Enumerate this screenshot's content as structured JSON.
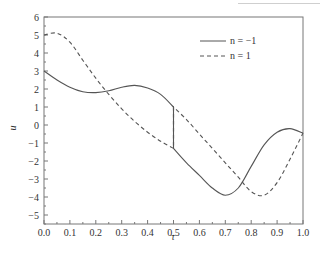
{
  "chart_data": {
    "type": "line",
    "title": "",
    "xlabel": "τ",
    "ylabel": "u",
    "xlim": [
      0.0,
      1.0
    ],
    "ylim": [
      -5.5,
      6
    ],
    "grid": false,
    "legend_position": "upper right (inside)",
    "x_ticks": [
      "0.0",
      "0.1",
      "0.2",
      "0.3",
      "0.4",
      "0.5",
      "0.6",
      "0.7",
      "0.8",
      "0.9",
      "1.0"
    ],
    "y_ticks": [
      "6",
      "5",
      "4",
      "3",
      "2",
      "1",
      "0",
      "−1",
      "−2",
      "−3",
      "−4",
      "−5"
    ],
    "annotations": [
      "vertical jump at τ = 0.5 (curves swap between u ≈ 1.0 and u ≈ −1.3)"
    ],
    "series": [
      {
        "name": "n = −1",
        "style": "solid",
        "color": "#555555",
        "x": [
          0.0,
          0.05,
          0.1,
          0.15,
          0.2,
          0.25,
          0.3,
          0.35,
          0.4,
          0.45,
          0.5,
          0.5,
          0.55,
          0.6,
          0.65,
          0.7,
          0.75,
          0.8,
          0.85,
          0.9,
          0.95,
          1.0
        ],
        "y": [
          3.0,
          2.5,
          2.1,
          1.85,
          1.8,
          1.9,
          2.1,
          2.2,
          2.05,
          1.7,
          1.0,
          -1.3,
          -2.1,
          -2.8,
          -3.5,
          -3.9,
          -3.5,
          -2.3,
          -1.1,
          -0.4,
          -0.2,
          -0.45
        ]
      },
      {
        "name": "n = 1",
        "style": "dashed",
        "color": "#555555",
        "x": [
          0.0,
          0.05,
          0.1,
          0.15,
          0.2,
          0.25,
          0.3,
          0.35,
          0.4,
          0.45,
          0.5,
          0.5,
          0.55,
          0.6,
          0.65,
          0.7,
          0.75,
          0.8,
          0.85,
          0.9,
          0.95,
          1.0
        ],
        "y": [
          5.0,
          5.1,
          4.6,
          3.6,
          2.6,
          1.7,
          0.9,
          0.2,
          -0.4,
          -0.9,
          -1.3,
          1.0,
          0.3,
          -0.5,
          -1.3,
          -2.1,
          -2.9,
          -3.7,
          -3.9,
          -3.2,
          -1.9,
          -0.45
        ]
      }
    ]
  }
}
